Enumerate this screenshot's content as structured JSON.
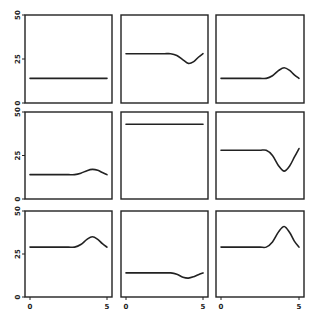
{
  "chart_data": {
    "type": "line",
    "title": "",
    "layout": {
      "rows": 3,
      "cols": 3,
      "grid": false,
      "legend": "none",
      "shared_axes": true
    },
    "xlabel": "",
    "ylabel": "",
    "xlim": [
      0,
      5
    ],
    "ylim": [
      0,
      50
    ],
    "x_ticks": [
      0,
      5
    ],
    "x_tick_labels": [
      "0",
      "5"
    ],
    "y_ticks": [
      0,
      25,
      50
    ],
    "y_tick_labels": [
      "0",
      "25",
      "50"
    ],
    "x": [
      0,
      0.5,
      1,
      1.5,
      2,
      2.5,
      2.9,
      3.3,
      3.7,
      4.05,
      4.4,
      4.7,
      5
    ],
    "panels": [
      {
        "name": "panel-1",
        "values": [
          14,
          14,
          14,
          14,
          14,
          14,
          14,
          14,
          14,
          14,
          14,
          14,
          14
        ]
      },
      {
        "name": "panel-2",
        "values": [
          28,
          28,
          28,
          28,
          28,
          28,
          28,
          27,
          24.5,
          22.5,
          23.5,
          26,
          28
        ]
      },
      {
        "name": "panel-3",
        "values": [
          14,
          14,
          14,
          14,
          14,
          14,
          14,
          15.5,
          18.5,
          20,
          18.5,
          16,
          14
        ]
      },
      {
        "name": "panel-4",
        "values": [
          14,
          14,
          14,
          14,
          14,
          14,
          14,
          14.8,
          16.3,
          17,
          16.5,
          15.2,
          14
        ]
      },
      {
        "name": "panel-5",
        "values": [
          43,
          43,
          43,
          43,
          43,
          43,
          43,
          43,
          43,
          43,
          43,
          43,
          43
        ]
      },
      {
        "name": "panel-6",
        "values": [
          28,
          28,
          28,
          28,
          28,
          28,
          28,
          25,
          19,
          16,
          19,
          24,
          29
        ]
      },
      {
        "name": "panel-7",
        "values": [
          29,
          29,
          29,
          29,
          29,
          29,
          29,
          30.5,
          33.5,
          35,
          33.5,
          31,
          29
        ]
      },
      {
        "name": "panel-8",
        "values": [
          14,
          14,
          14,
          14,
          14,
          14,
          14,
          13.2,
          11.5,
          11,
          11.8,
          13,
          14
        ]
      },
      {
        "name": "panel-9",
        "values": [
          29,
          29,
          29,
          29,
          29,
          29,
          29,
          32,
          38,
          41,
          37.5,
          32.5,
          29
        ]
      }
    ]
  },
  "geometry": {
    "col_x": [
      [
        25,
        112
      ],
      [
        121,
        208
      ],
      [
        216,
        304
      ]
    ],
    "row_y": [
      [
        15,
        103
      ],
      [
        112,
        199
      ],
      [
        211,
        297
      ]
    ],
    "x_inset": 5
  },
  "colors": {
    "line": "#222222",
    "background": "#ffffff"
  }
}
